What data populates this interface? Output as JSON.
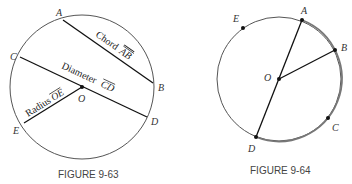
{
  "figures": [
    {
      "caption": "FIGURE 9-63",
      "points": {
        "A": "A",
        "B": "B",
        "C": "C",
        "D": "D",
        "E": "E",
        "O": "O"
      },
      "segments": {
        "chord": {
          "word": "Chord",
          "name": "AB"
        },
        "diameter": {
          "word": "Diameter",
          "name": "CD"
        },
        "radius": {
          "word": "Radius",
          "name": "OE"
        }
      }
    },
    {
      "caption": "FIGURE 9-64",
      "points": {
        "A": "A",
        "B": "B",
        "C": "C",
        "D": "D",
        "E": "E",
        "O": "O"
      }
    }
  ],
  "colors": {
    "circle": "#555555",
    "segment": "#111111",
    "arc_highlight": "#777777"
  }
}
